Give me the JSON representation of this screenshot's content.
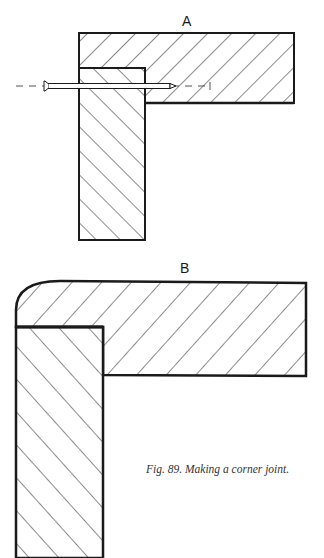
{
  "figure": {
    "label_a": "A",
    "label_b": "B",
    "caption": "Fig. 89. Making a corner joint.",
    "colors": {
      "ink": "#1a1a1a",
      "background": "#ffffff",
      "dash": "#555555"
    }
  }
}
